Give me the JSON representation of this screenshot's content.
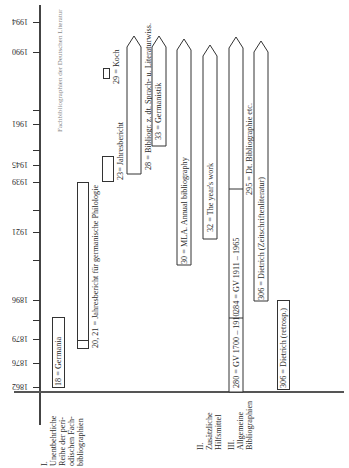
{
  "title": "Fachbibliographien der Deutschen Literatur",
  "axis": {
    "years": [
      {
        "label": "1994",
        "y": 22
      },
      {
        "label": "1990",
        "y": 52
      },
      {
        "label": "1961",
        "y": 124
      },
      {
        "label": "1945",
        "y": 165
      },
      {
        "label": "1939",
        "y": 182
      },
      {
        "label": "1921",
        "y": 232
      },
      {
        "label": "1896",
        "y": 300
      },
      {
        "label": "1879",
        "y": 339
      },
      {
        "label": "1876",
        "y": 363
      },
      {
        "label": "1862",
        "y": 387
      }
    ]
  },
  "sections": [
    {
      "num": "I.",
      "lines": [
        "Unentbehrliche",
        "Reihe der peri-",
        "odischen Fach-",
        "bibliographien"
      ]
    },
    {
      "num": "II.",
      "lines": [
        "Zusätzliche",
        "Hilfsmittel"
      ]
    },
    {
      "num": "III.",
      "lines": [
        "Allgemeine",
        "Bibliographien"
      ]
    }
  ],
  "entries": {
    "germania": "18 = Germania",
    "jahresbericht_germ": "20, 21 = Jahresbericht für germanische Philologie",
    "jahresbericht_23": "23= Jahresbericht",
    "koch": "29 = Koch",
    "bibliogr_28": "28 = Bibliogr. z. dt. Sprach- u. Literaturwiss.",
    "germanistik": "33 = Germanistik",
    "mla": "30 = MLA. Annual bibliography",
    "years_work": "32 = The year's work",
    "gv_1700": "280 = GV 1700 – 1910",
    "gv_1911": "284 = GV 1911 – 1965",
    "dt_bibliographie": "295 = Dt. Bibliographie etc.",
    "dietrich_zeit": "306 = Dietrich (Zeitschriftenliteratur)",
    "dietrich_retro": "306 = Dietrich (retrosp.)"
  }
}
